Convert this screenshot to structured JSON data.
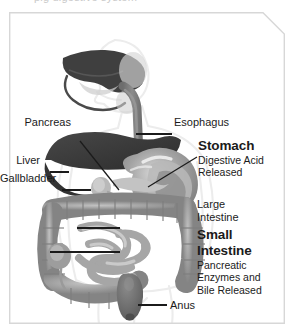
{
  "figure": {
    "cutoff_caption": "pig digestive system",
    "border_color": "#d7d7d7",
    "background_color": "#ffffff",
    "leader_line_color": "#1b1b1b",
    "body_outline_color": "#ebebeb"
  },
  "palette": {
    "liver_dark": "#3a3a3a",
    "stomach_gray": "#8e8e8e",
    "stomach_highlight": "#d4d4d4",
    "esophagus_gray": "#7f7f7f",
    "intestine_gray": "#9a9a9a",
    "intestine_light": "#bdbdbd",
    "rectum_gray": "#6e6e6e",
    "gallbladder_gray": "#b5b5b5",
    "pancreas_gray": "#c6c6c6"
  },
  "labels": {
    "pancreas": {
      "text": "Pancreas",
      "style": "regular",
      "side": "left"
    },
    "liver": {
      "text": "Liver",
      "style": "regular",
      "side": "left"
    },
    "gallbladder": {
      "text": "Gallbladder",
      "style": "regular",
      "side": "left"
    },
    "esophagus": {
      "text": "Esophagus",
      "style": "regular",
      "side": "right"
    },
    "stomach": {
      "text": "Stomach",
      "style": "bold",
      "side": "right",
      "detail_line1": "Digestive Acid",
      "detail_line2": "Released"
    },
    "large_intestine": {
      "text_line1": "Large",
      "text_line2": "Intestine",
      "style": "regular",
      "side": "right"
    },
    "small_intestine": {
      "text_line1": "Small",
      "text_line2": "Intestine",
      "style": "bold",
      "side": "right",
      "detail_line1": "Pancreatic",
      "detail_line2": "Enzymes and",
      "detail_line3": "Bile Released"
    },
    "anus": {
      "text": "Anus",
      "style": "regular",
      "side": "right"
    }
  }
}
